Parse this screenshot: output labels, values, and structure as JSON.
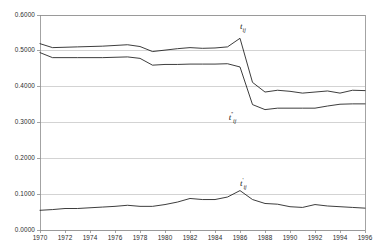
{
  "chart_data": {
    "type": "line",
    "title": "",
    "subtitle": "",
    "xlabel": "",
    "ylabel": "",
    "xlim": [
      1970,
      1996
    ],
    "ylim": [
      0.0,
      0.6
    ],
    "grid": true,
    "legend_position": "inline-annotation",
    "x_tick_labels": [
      "1970",
      "1972",
      "1974",
      "1976",
      "1978",
      "1980",
      "1982",
      "1984",
      "1986",
      "1988",
      "1990",
      "1992",
      "1994",
      "1996"
    ],
    "x_tick_values": [
      1970,
      1972,
      1974,
      1976,
      1978,
      1980,
      1982,
      1984,
      1986,
      1988,
      1990,
      1992,
      1994,
      1996
    ],
    "y_tick_labels": [
      "0.0000",
      "0.1000",
      "0.2000",
      "0.3000",
      "0.4000",
      "0.5000",
      "0.6000"
    ],
    "y_tick_values": [
      0.0,
      0.1,
      0.2,
      0.3,
      0.4,
      0.5,
      0.6
    ],
    "line_color": "#1a1a1a",
    "grid_color": "#c8c8c8",
    "axis_color": "#8c8c8c",
    "x": [
      1970,
      1971,
      1972,
      1973,
      1974,
      1975,
      1976,
      1977,
      1978,
      1979,
      1980,
      1981,
      1982,
      1983,
      1984,
      1985,
      1986,
      1987,
      1988,
      1989,
      1990,
      1991,
      1992,
      1993,
      1994,
      1995,
      1996
    ],
    "series": [
      {
        "name": "t_ij",
        "label_text": "t",
        "label_sup": "",
        "label_sub": "ij",
        "label_x": 1986.0,
        "label_y": 0.566,
        "values": [
          0.52,
          0.509,
          0.51,
          0.511,
          0.512,
          0.513,
          0.515,
          0.517,
          0.512,
          0.498,
          0.502,
          0.506,
          0.509,
          0.507,
          0.508,
          0.511,
          0.535,
          0.412,
          0.385,
          0.39,
          0.387,
          0.382,
          0.385,
          0.388,
          0.382,
          0.39,
          0.389
        ]
      },
      {
        "name": "t_ij_double_prime",
        "label_text": "t",
        "label_sup": "''",
        "label_sub": "ij",
        "label_x": 1985.1,
        "label_y": 0.318,
        "values": [
          0.495,
          0.481,
          0.481,
          0.481,
          0.481,
          0.481,
          0.482,
          0.483,
          0.479,
          0.46,
          0.462,
          0.462,
          0.463,
          0.463,
          0.463,
          0.464,
          0.455,
          0.35,
          0.336,
          0.34,
          0.34,
          0.34,
          0.34,
          0.346,
          0.351,
          0.352,
          0.352
        ]
      },
      {
        "name": "t_ij_prime",
        "label_text": "t",
        "label_sup": "'",
        "label_sub": "ij",
        "label_x": 1986.0,
        "label_y": 0.135,
        "values": [
          0.055,
          0.057,
          0.06,
          0.06,
          0.062,
          0.064,
          0.066,
          0.069,
          0.066,
          0.066,
          0.071,
          0.078,
          0.088,
          0.085,
          0.085,
          0.092,
          0.11,
          0.085,
          0.074,
          0.072,
          0.065,
          0.063,
          0.071,
          0.067,
          0.065,
          0.063,
          0.061
        ]
      }
    ]
  }
}
